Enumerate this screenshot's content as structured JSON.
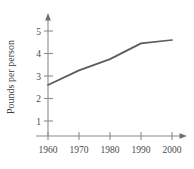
{
  "chart_data": {
    "type": "line",
    "title": "",
    "xlabel": "",
    "ylabel": "Pounds per person",
    "x": [
      1960,
      1970,
      1980,
      1990,
      2000
    ],
    "values": [
      2.6,
      3.25,
      3.75,
      4.45,
      4.6
    ],
    "series": [
      {
        "name": "Pounds per person",
        "values": [
          2.6,
          3.25,
          3.75,
          4.45,
          4.6
        ]
      }
    ],
    "xtick_labels": [
      "1960",
      "1970",
      "1980",
      "1990",
      "2000"
    ],
    "ytick_labels": [
      "1",
      "2",
      "3",
      "4",
      "5"
    ],
    "ytick_values": [
      1,
      2,
      3,
      4,
      5
    ],
    "xlim": [
      1955,
      2005
    ],
    "ylim": [
      0,
      5.6
    ],
    "grid": false,
    "legend": "none",
    "line_color": "#5b5b5b",
    "axis_color": "#8c8c8c",
    "text_color": "#4a4a4a"
  }
}
